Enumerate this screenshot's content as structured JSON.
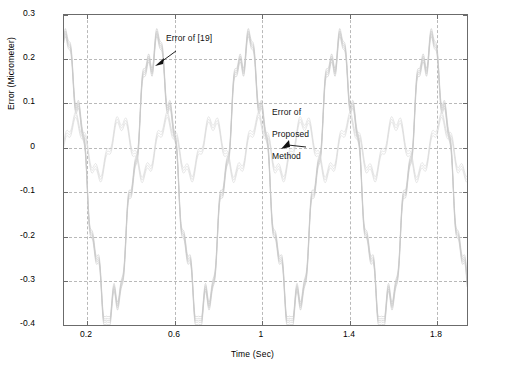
{
  "chart_data": {
    "type": "line",
    "title": "",
    "xlabel": "Time (Sec)",
    "ylabel": "Error (Micrometer)",
    "xlim": [
      0.1,
      1.95
    ],
    "ylim": [
      -0.4,
      0.3
    ],
    "xticks": [
      "0.2",
      "0.6",
      "1",
      "1.4",
      "1.8"
    ],
    "xtick_values": [
      0.2,
      0.6,
      1.0,
      1.4,
      1.8
    ],
    "yticks": [
      "0.3",
      "0.2",
      "0.1",
      "0",
      "-0.1",
      "-0.2",
      "-0.3",
      "-0.4"
    ],
    "ytick_values": [
      0.3,
      0.2,
      0.1,
      0,
      -0.1,
      -0.2,
      -0.3,
      -0.4
    ],
    "grid": true,
    "legend_position": "none",
    "series": [
      {
        "name": "Error of [19]",
        "color": "#c8c8c8",
        "description": "Large-amplitude oscillatory error trace, periodic, peaks near +0.23 and troughs near -0.38",
        "period": 0.42,
        "amplitude_max": 0.23,
        "amplitude_min": -0.38
      },
      {
        "name": "Error of Proposed Method",
        "color": "#d8d8d8",
        "description": "Smaller-amplitude oscillatory error trace near zero",
        "period": 0.42,
        "amplitude_max": 0.06,
        "amplitude_min": -0.06
      }
    ],
    "annotations": [
      {
        "text": "Error of [19]",
        "x": 0.62,
        "y": 0.255,
        "arrow_to_x": 0.56,
        "arrow_to_y": 0.2
      },
      {
        "text": "Error of\nProposed\nMethod",
        "x": 1.12,
        "y": 0.135,
        "arrow_to_x": 1.12,
        "arrow_to_y": 0.01
      }
    ]
  },
  "axes": {
    "xlabel": "Time (Sec)",
    "ylabel": "Error (Micrometer)"
  },
  "annotations": {
    "first": "Error of [19]",
    "second_line1": "Error of",
    "second_line2": "Proposed",
    "second_line3": "Method"
  }
}
